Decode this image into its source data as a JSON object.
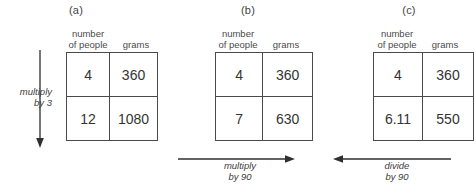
{
  "figure": {
    "background": "#ffffff",
    "line_color": "#4a4a4a",
    "text_color": "#333333"
  },
  "columns": {
    "people_line1": "number",
    "people_line2": "of people",
    "grams": "grams"
  },
  "panels": [
    {
      "label": "(a)",
      "rows": [
        {
          "people": "4",
          "grams": "360"
        },
        {
          "people": "12",
          "grams": "1080"
        }
      ],
      "annotation": {
        "line1": "multiply",
        "line2": "by 3",
        "direction": "down"
      }
    },
    {
      "label": "(b)",
      "rows": [
        {
          "people": "4",
          "grams": "360"
        },
        {
          "people": "7",
          "grams": "630"
        }
      ],
      "annotation": {
        "line1": "multiply",
        "line2": "by 90",
        "direction": "right"
      }
    },
    {
      "label": "(c)",
      "rows": [
        {
          "people": "4",
          "grams": "360"
        },
        {
          "people": "6.11",
          "grams": "550"
        }
      ],
      "annotation": {
        "line1": "divide",
        "line2": "by 90",
        "direction": "left"
      }
    }
  ]
}
